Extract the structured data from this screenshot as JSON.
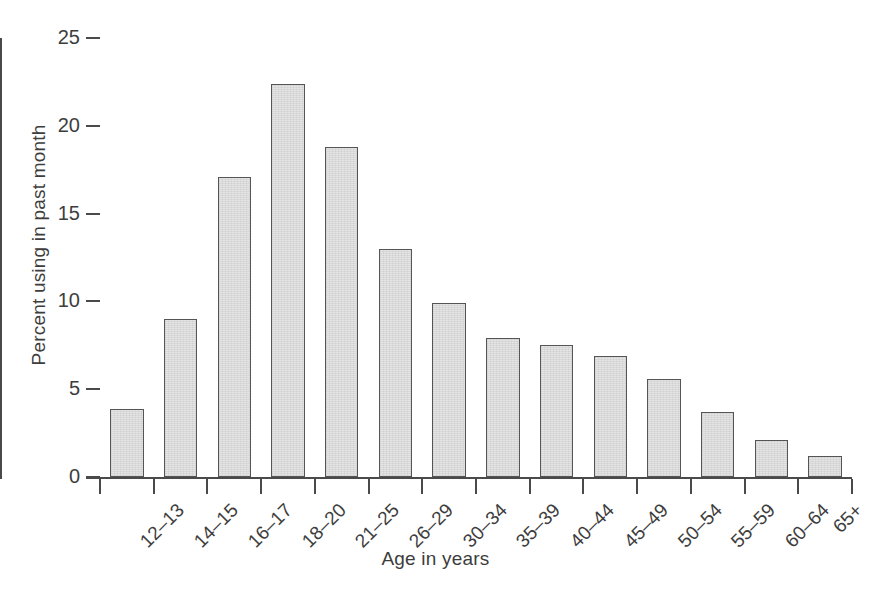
{
  "chart_data": {
    "type": "bar",
    "title": "",
    "subtitle": "",
    "xlabel": "Age in years",
    "ylabel": "Percent using in past month",
    "categories": [
      "12–13",
      "14–15",
      "16–17",
      "18–20",
      "21–25",
      "26–29",
      "30–34",
      "35–39",
      "40–44",
      "45–49",
      "50–54",
      "55–59",
      "60–64",
      "65+"
    ],
    "values": [
      3.9,
      9.0,
      17.1,
      22.4,
      18.8,
      13.0,
      9.9,
      7.9,
      7.5,
      6.9,
      5.6,
      3.7,
      2.1,
      1.2
    ],
    "ylim": [
      0,
      25
    ],
    "ytick_labels": [
      "0",
      "5",
      "10",
      "15",
      "20",
      "25"
    ],
    "ytick_values": [
      0,
      5,
      10,
      15,
      20,
      25
    ],
    "grid": false,
    "legend": false,
    "legend_position": "none",
    "bar_fill_color": "#e4e4e4",
    "bar_edge_color": "#555555",
    "axis_color": "#4a4a4a",
    "text_color": "#3d3d3d",
    "background_color": "#ffffff"
  }
}
